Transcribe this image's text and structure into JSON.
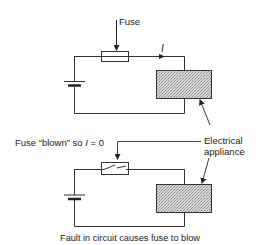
{
  "diagram": {
    "type": "circuit-comparison",
    "top_circuit": {
      "fuse_label": "Fuse",
      "current_label": "I",
      "state": "intact"
    },
    "bottom_circuit": {
      "fuse_label_prefix": "Fuse “blown” so ",
      "fuse_label_var": "I",
      "fuse_label_suffix": " = 0",
      "state": "blown"
    },
    "appliance_label_line1": "Electrical",
    "appliance_label_line2": "appliance",
    "caption": "Fault in circuit causes fuse to blow",
    "colors": {
      "line": "#333333",
      "appliance_fill": "#c8c8c8",
      "background": "#ffffff"
    }
  }
}
